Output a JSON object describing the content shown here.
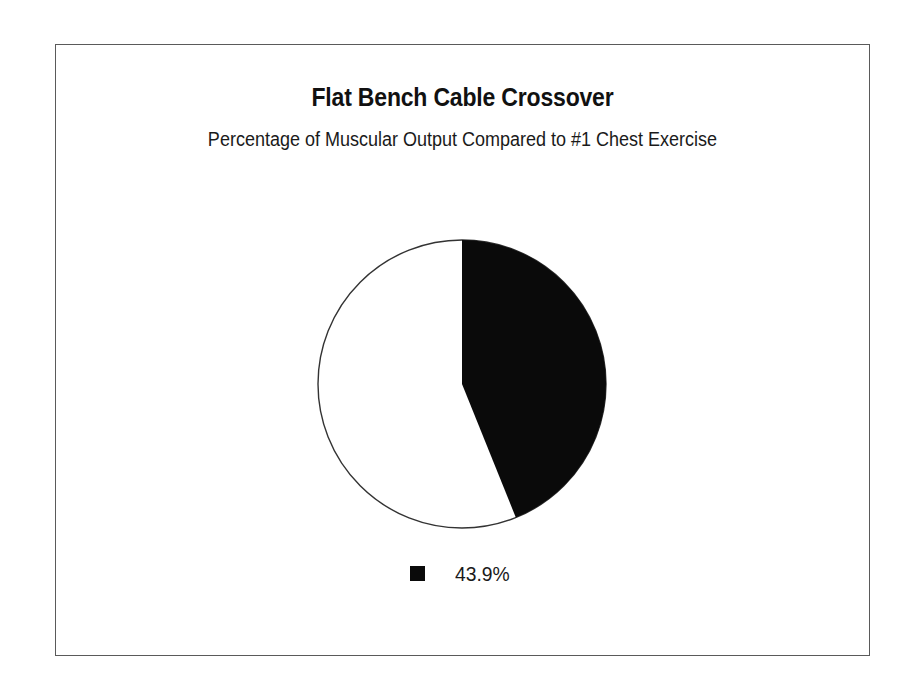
{
  "chart_data": {
    "type": "pie",
    "title": "Flat Bench Cable Crossover",
    "subtitle": "Percentage of Muscular Output Compared to #1 Chest Exercise",
    "categories": [
      "43.9%",
      "Remainder"
    ],
    "values": [
      43.9,
      56.1
    ],
    "labels": [
      "43.9%"
    ],
    "legend": [
      {
        "label": "43.9%",
        "color": "#0a0a0a"
      }
    ],
    "slices": [
      {
        "label": "43.9%",
        "value": 43.9,
        "color": "#0a0a0a",
        "start_angle_deg": 0,
        "sweep_deg": 158.04
      },
      {
        "label": "",
        "value": 56.1,
        "color": "#ffffff",
        "start_angle_deg": 158.04,
        "sweep_deg": 201.96
      }
    ],
    "start_angle": "12 o'clock",
    "direction": "clockwise",
    "legend_position": "bottom",
    "grid": false,
    "xlabel": "",
    "ylabel": ""
  },
  "frame": {
    "border_color": "#5a5a5a",
    "background": "#ffffff"
  },
  "pie_geometry": {
    "center_x": 148,
    "center_y": 145,
    "radius": 144,
    "outline_color": "#333333"
  }
}
